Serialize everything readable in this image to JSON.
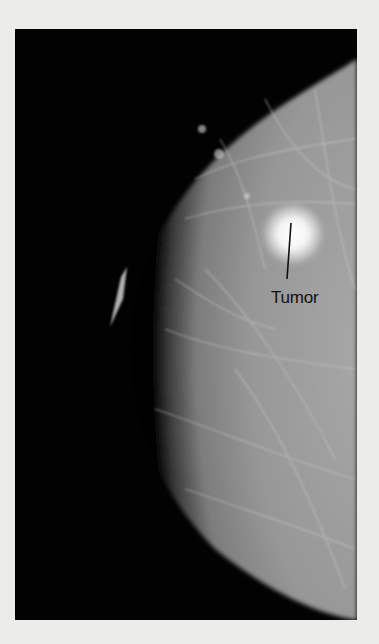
{
  "figure": {
    "type": "mammogram",
    "annotation": {
      "label": "Tumor",
      "target": "bright mass in upper-right breast tissue"
    },
    "colors": {
      "page_background": "#ececea",
      "image_background": "#020202",
      "tissue": "#8f8f8f",
      "tumor": "#ffffff",
      "label_text": "#111111"
    }
  }
}
